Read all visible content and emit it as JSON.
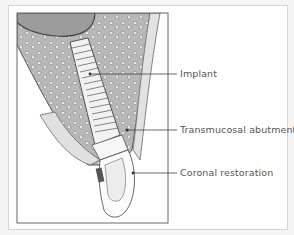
{
  "figure": {
    "labels": [
      {
        "id": "implant",
        "text": "Implant"
      },
      {
        "id": "abutment",
        "text": "Transmucosal abutment"
      },
      {
        "id": "restoration",
        "text": "Coronal restoration"
      }
    ]
  },
  "colors": {
    "bone_dark": "#9a9a9a",
    "bone_medium": "#bdbdbd",
    "soft_tissue": "#e6e6e6",
    "outline": "#555555",
    "marker": "#555555"
  }
}
